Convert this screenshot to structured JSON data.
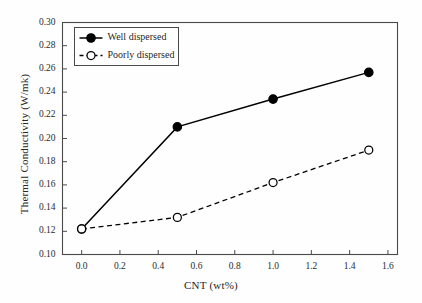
{
  "chart_data": {
    "type": "line",
    "title": "",
    "subtitle": "",
    "xlabel": "CNT (wt%)",
    "ylabel": "Thermal Conductivity (W/mk)",
    "xlim": [
      -0.1,
      1.65
    ],
    "ylim": [
      0.1,
      0.3
    ],
    "grid": false,
    "legend_position": "top-left",
    "xticks": [
      "0.0",
      "0.2",
      "0.4",
      "0.6",
      "0.8",
      "1.0",
      "1.2",
      "1.4",
      "1.6"
    ],
    "xtick_values": [
      0.0,
      0.2,
      0.4,
      0.6,
      0.8,
      1.0,
      1.2,
      1.4,
      1.6
    ],
    "yticks": [
      "0.10",
      "0.12",
      "0.14",
      "0.16",
      "0.18",
      "0.20",
      "0.22",
      "0.24",
      "0.26",
      "0.28",
      "0.30"
    ],
    "ytick_values": [
      0.1,
      0.12,
      0.14,
      0.16,
      0.18,
      0.2,
      0.22,
      0.24,
      0.26,
      0.28,
      0.3
    ],
    "x": [
      0.0,
      0.5,
      1.0,
      1.5
    ],
    "series": [
      {
        "name": "Well dispersed",
        "values": [
          0.122,
          0.21,
          0.234,
          0.257
        ],
        "line_style": "solid",
        "marker": "filled-circle",
        "color": "#000000"
      },
      {
        "name": "Poorly dispersed",
        "values": [
          0.122,
          0.132,
          0.162,
          0.19
        ],
        "line_style": "dashed",
        "marker": "open-circle",
        "color": "#000000"
      }
    ]
  },
  "legend": {
    "entries": [
      {
        "label": "Well dispersed",
        "marker": "filled-circle",
        "line_style": "solid"
      },
      {
        "label": "Poorly dispersed",
        "marker": "open-circle",
        "line_style": "dashed"
      }
    ]
  },
  "axes": {
    "x_title": "CNT (wt%)",
    "y_title": "Thermal Conductivity (W/mk)",
    "x_tick_labels": [
      "0.0",
      "0.2",
      "0.4",
      "0.6",
      "0.8",
      "1.0",
      "1.2",
      "1.4",
      "1.6"
    ],
    "y_tick_labels": [
      "0.10",
      "0.12",
      "0.14",
      "0.16",
      "0.18",
      "0.20",
      "0.22",
      "0.24",
      "0.26",
      "0.28",
      "0.30"
    ]
  },
  "style": {
    "background": "#fefefe",
    "axis_color": "#4a4a4a",
    "series_color": "#000000",
    "text_color": "#1f1f1f"
  }
}
